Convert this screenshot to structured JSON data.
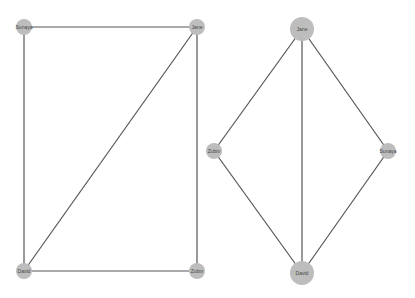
{
  "graphs": [
    {
      "name": "left-graph",
      "nodes": [
        {
          "id": "Sunaya",
          "label": "Sunaya",
          "size": "small"
        },
        {
          "id": "Jane",
          "label": "Jane",
          "size": "small"
        },
        {
          "id": "David",
          "label": "David",
          "size": "small"
        },
        {
          "id": "Zubin",
          "label": "Zubin",
          "size": "small"
        }
      ],
      "edges": [
        [
          "Sunaya",
          "Jane"
        ],
        [
          "Sunaya",
          "David"
        ],
        [
          "Jane",
          "David"
        ],
        [
          "Jane",
          "Zubin"
        ],
        [
          "David",
          "Zubin"
        ]
      ]
    },
    {
      "name": "right-graph",
      "nodes": [
        {
          "id": "Jane",
          "label": "Jane",
          "size": "large"
        },
        {
          "id": "Zubin",
          "label": "Zubin",
          "size": "small"
        },
        {
          "id": "Sunaya",
          "label": "Sunaya",
          "size": "small"
        },
        {
          "id": "David",
          "label": "David",
          "size": "large"
        }
      ],
      "edges": [
        [
          "Jane",
          "Zubin"
        ],
        [
          "Jane",
          "David"
        ],
        [
          "Jane",
          "Sunaya"
        ],
        [
          "Zubin",
          "David"
        ],
        [
          "Sunaya",
          "David"
        ]
      ]
    }
  ],
  "colors": {
    "node": "#bdbdbd",
    "edge": "#555555",
    "label": "#444444"
  }
}
